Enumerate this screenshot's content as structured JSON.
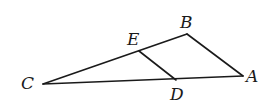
{
  "diagram": {
    "type": "geometry-triangle",
    "points": {
      "C": {
        "x": 43,
        "y": 84
      },
      "B": {
        "x": 187,
        "y": 34
      },
      "A": {
        "x": 243,
        "y": 76
      },
      "E": {
        "x": 139,
        "y": 51
      },
      "D": {
        "x": 176,
        "y": 80
      }
    },
    "segments": [
      {
        "from": "C",
        "to": "B"
      },
      {
        "from": "B",
        "to": "A"
      },
      {
        "from": "A",
        "to": "C"
      },
      {
        "from": "E",
        "to": "D"
      }
    ],
    "labels": {
      "A": "A",
      "B": "B",
      "C": "C",
      "D": "D",
      "E": "E"
    },
    "stroke_color": "#1a1a1a"
  }
}
